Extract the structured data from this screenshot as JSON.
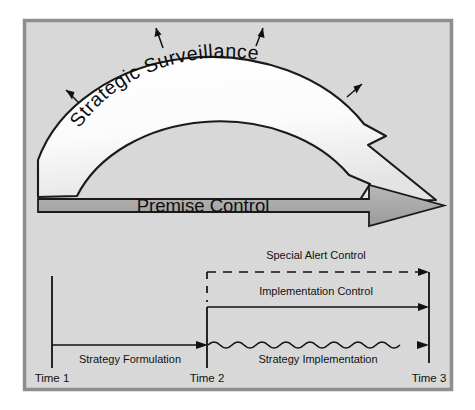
{
  "figure": {
    "frame": {
      "background_color": "#d8d8d8",
      "border_color": "#8e8e8e",
      "outer_background": "#ffffff"
    },
    "arc_arrow": {
      "label": "Strategic  Surveillance",
      "fill_color": "#fbfbfb",
      "outline_color": "#1a1a1a",
      "radiating_arrow_count": 4,
      "direction": "left-to-right over the top, pointing down-right"
    },
    "straight_arrow": {
      "label": "Premise Control",
      "fill_color": "#a9a9a9",
      "outline_color": "#1a1a1a",
      "direction": "left-to-right"
    },
    "timeline": {
      "axis_color": "#1a1a1a",
      "ticks": [
        {
          "id": "t1",
          "label": "Time 1"
        },
        {
          "id": "t2",
          "label": "Time 2"
        },
        {
          "id": "t3",
          "label": "Time 3"
        }
      ],
      "phase_labels": [
        {
          "id": "formulation",
          "label": "Strategy Formulation",
          "line_style": "straight"
        },
        {
          "id": "implementation",
          "label": "Strategy Implementation",
          "line_style": "wavy"
        }
      ],
      "control_bands": [
        {
          "id": "special-alert",
          "label": "Special Alert Control",
          "line_style": "dashed",
          "span": "Time 2 to Time 3"
        },
        {
          "id": "implementation-control",
          "label": "Implementation Control",
          "line_style": "solid",
          "span": "Time 2 to Time 3"
        }
      ]
    }
  }
}
